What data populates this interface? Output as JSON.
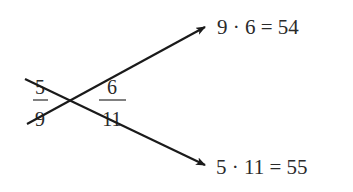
{
  "diagram": {
    "type": "cross-multiplication",
    "fractions": [
      {
        "numerator": "5",
        "denominator": "9"
      },
      {
        "numerator": "6",
        "denominator": "11"
      }
    ],
    "products": [
      {
        "label": "9 · 6 = 54",
        "factors": [
          "9",
          "6"
        ],
        "result": "54"
      },
      {
        "label": "5 · 11 = 55",
        "factors": [
          "5",
          "11"
        ],
        "result": "55"
      }
    ],
    "colors": {
      "ink": "#1a1a1a",
      "text": "#2a2a2a",
      "background": "#ffffff"
    }
  }
}
